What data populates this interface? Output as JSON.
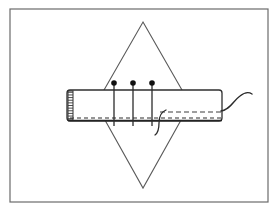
{
  "figure": {
    "title": "Sewing illustration: waistband pinned to diamond fabric panel",
    "caption": "",
    "background_color": "#ffffff",
    "ink_color": "#2b2b2b",
    "line_color": "#4a4a4a",
    "frame": {
      "name": "illustration-border",
      "x": 10,
      "y": 9,
      "width": 258,
      "height": 193,
      "stroke": "#6b6b6b",
      "stroke_width": 1.2,
      "fill": "#ffffff"
    },
    "diamond_panel": {
      "name": "diamond-fabric-panel",
      "top_apex": [
        143,
        22
      ],
      "right_vertex": [
        190,
        104
      ],
      "bottom_apex": [
        143,
        188
      ],
      "left_vertex": [
        96,
        104
      ],
      "stroke": "#5a5a5a",
      "stroke_width": 1.1,
      "fill": "none"
    },
    "band": {
      "name": "waistband-strip",
      "x": 67,
      "y": 90,
      "width": 155,
      "height": 31,
      "corner_radius": 3,
      "stroke": "#2f2f2f",
      "stroke_width": 1.3,
      "fill": "#ffffff",
      "left_edge_band": {
        "name": "band-finished-left-edge",
        "x": 68,
        "y": 91,
        "width": 5,
        "height": 29,
        "hatch_count": 11
      },
      "bottom_stitch_line": {
        "name": "bottom-stitch-line",
        "x1": 70,
        "x2": 221,
        "y": 118,
        "dash": "4 3",
        "stroke_width": 1.1
      },
      "bottom_edge_line": {
        "name": "band-lower-edge",
        "x1": 68,
        "x2": 222,
        "y": 120.5,
        "stroke_width": 1.4
      },
      "fold_dashed_line": {
        "name": "fold-dashed-line",
        "x1": 160,
        "x2": 221,
        "y": 112,
        "dash": "5 3",
        "stroke_width": 1.0
      }
    },
    "pins": {
      "name": "pin-group",
      "head_radius": 2.8,
      "shaft_top": 82,
      "shaft_bottom": 126,
      "stroke_width": 1.3,
      "items": [
        {
          "name": "pin-1",
          "x": 114,
          "label": "pin 1"
        },
        {
          "name": "pin-2",
          "x": 133,
          "label": "pin 2"
        },
        {
          "name": "pin-3",
          "x": 152,
          "label": "pin 3"
        }
      ]
    },
    "threads": [
      {
        "name": "thread-tail-right",
        "path": "M 221 111 C 230 110 233 101 240 96 C 245 92 249 92 252 94",
        "stroke_width": 1.4
      },
      {
        "name": "thread-loop-lower",
        "path": "M 166 110 C 161 112 159 117 159 123 C 159 129 158 133 155 135",
        "stroke_width": 1.3
      }
    ],
    "annotations": {
      "pins_count_label": "3",
      "band_label": "band",
      "panel_label": "diamond panel"
    }
  }
}
